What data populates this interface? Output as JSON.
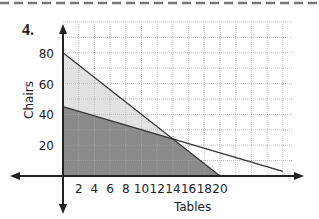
{
  "problem_number": "4.",
  "chart_data": {
    "type": "area",
    "title": "",
    "xlabel": "Tables",
    "ylabel": "Chairs",
    "xlim": [
      0,
      30
    ],
    "ylim": [
      0,
      100
    ],
    "x_ticks": [
      2,
      4,
      6,
      8,
      10,
      12,
      14,
      16,
      18,
      20
    ],
    "y_ticks": [
      20,
      40,
      60,
      80
    ],
    "grid": true,
    "lines": [
      {
        "name": "line1",
        "x": [
          0,
          20
        ],
        "y": [
          80,
          0
        ],
        "equation": "y = 80 - 4x"
      },
      {
        "name": "line2",
        "x": [
          0,
          28
        ],
        "y": [
          45,
          3
        ],
        "equation": "y = 45 - 1.5x"
      }
    ],
    "intersection": {
      "x": 14,
      "y": 24
    },
    "regions": [
      {
        "name": "light-shaded",
        "vertices": [
          [
            0,
            80
          ],
          [
            14,
            24
          ],
          [
            0,
            45
          ]
        ],
        "color": "#e2e2e2"
      },
      {
        "name": "dark-shaded",
        "vertices": [
          [
            0,
            0
          ],
          [
            0,
            45
          ],
          [
            14,
            24
          ],
          [
            20,
            0
          ]
        ],
        "color": "#8a8a8a"
      }
    ]
  }
}
